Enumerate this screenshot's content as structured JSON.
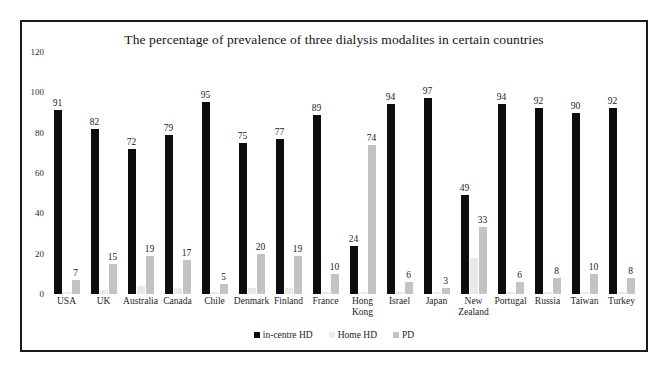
{
  "chart_data": {
    "type": "bar",
    "title": "The percentage of prevalence of three dialysis modalites in certain countries",
    "xlabel": "",
    "ylabel": "",
    "ylim": [
      0,
      120
    ],
    "yticks": [
      0,
      20,
      40,
      60,
      80,
      100,
      120
    ],
    "grid": false,
    "legend_position": "bottom",
    "categories": [
      "USA",
      "UK",
      "Australia",
      "Canada",
      "Chile",
      "Denmark",
      "Finland",
      "France",
      "Hong Kong",
      "Israel",
      "Japan",
      "New Zealand",
      "Portugal",
      "Russia",
      "Taiwan",
      "Turkey"
    ],
    "series": [
      {
        "name": "in-centre HD",
        "color": "#0d0d0d",
        "values": [
          91,
          82,
          72,
          79,
          95,
          75,
          77,
          89,
          24,
          94,
          97,
          49,
          94,
          92,
          90,
          92
        ],
        "labels": [
          "91",
          "82",
          "72",
          "79",
          "95",
          "75",
          "77",
          "89",
          "24",
          "94",
          "97",
          "49",
          "94",
          "92",
          "90",
          "92"
        ]
      },
      {
        "name": "Home HD",
        "color": "#e9e9e9",
        "values": [
          1,
          2,
          4,
          3,
          1,
          3,
          3,
          1,
          1,
          1,
          1,
          18,
          1,
          1,
          1,
          1
        ],
        "labels": [
          "",
          "",
          "",
          "",
          "",
          "",
          "",
          "",
          "",
          "",
          "",
          "",
          "",
          "",
          "",
          ""
        ]
      },
      {
        "name": "PD",
        "color": "#c3c3c3",
        "values": [
          7,
          15,
          19,
          17,
          5,
          20,
          19,
          10,
          74,
          6,
          3,
          33,
          6,
          8,
          10,
          8
        ],
        "labels": [
          "7",
          "15",
          "19",
          "17",
          "5",
          "20",
          "19",
          "10",
          "74",
          "6",
          "3",
          "33",
          "6",
          "8",
          "10",
          "8"
        ]
      }
    ]
  }
}
